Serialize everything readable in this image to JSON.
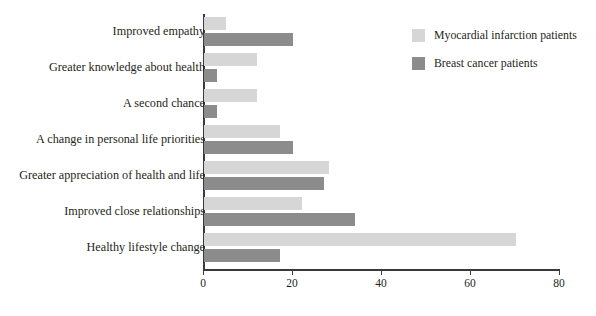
{
  "chart_data": {
    "type": "bar",
    "orientation": "horizontal",
    "title": "",
    "xlabel": "",
    "ylabel": "",
    "xlim": [
      0,
      80
    ],
    "xticks": [
      0,
      20,
      40,
      60,
      80
    ],
    "grid": false,
    "legend_position": "top-right",
    "categories": [
      "Improved empathy",
      "Greater knowledge about health",
      "A second chance",
      "A change in personal life priorities",
      "Greater appreciation of health and life",
      "Improved close relationships",
      "Healthy lifestyle change"
    ],
    "series": [
      {
        "name": "Myocardial infarction patients",
        "color": "#d6d6d6",
        "values": [
          5,
          12,
          12,
          17,
          28,
          22,
          70
        ]
      },
      {
        "name": "Breast cancer patients",
        "color": "#8c8c8c",
        "values": [
          20,
          3,
          3,
          20,
          27,
          34,
          17
        ]
      }
    ]
  },
  "axis": {
    "tick_labels": [
      "0",
      "20",
      "40",
      "60",
      "80"
    ]
  },
  "legend": {
    "items": [
      {
        "label": "Myocardial infarction patients",
        "color": "#d6d6d6"
      },
      {
        "label": "Breast cancer patients",
        "color": "#8c8c8c"
      }
    ]
  }
}
